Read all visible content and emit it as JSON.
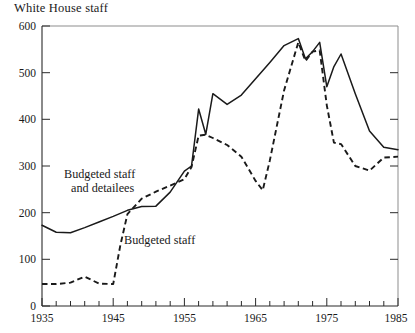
{
  "chart_data": {
    "type": "line",
    "title": "White House staff",
    "xlabel": "",
    "ylabel": "",
    "xlim": [
      1935,
      1985
    ],
    "ylim": [
      0,
      600
    ],
    "yticks": [
      0,
      100,
      200,
      300,
      400,
      500,
      600
    ],
    "ytick_labels": [
      "0",
      "100",
      "200",
      "300",
      "400",
      "500",
      "600"
    ],
    "xticks": [
      1935,
      1937,
      1939,
      1941,
      1943,
      1945,
      1947,
      1949,
      1951,
      1953,
      1955,
      1957,
      1959,
      1961,
      1963,
      1965,
      1967,
      1969,
      1971,
      1973,
      1975,
      1977,
      1979,
      1981,
      1983,
      1985
    ],
    "xtick_labels_shown": [
      "1935",
      "1945",
      "1955",
      "1965",
      "1975",
      "1985"
    ],
    "xtick_label_years": [
      1935,
      1945,
      1955,
      1965,
      1975,
      1985
    ],
    "grid": false,
    "legend_position": "inline-annotation",
    "series": [
      {
        "name": "Budgeted staff and detailees",
        "style": "solid",
        "label_text_line1": "Budgeted staff",
        "label_text_line2": "and detailees",
        "x": [
          1935,
          1937,
          1939,
          1941,
          1943,
          1945,
          1947,
          1949,
          1951,
          1953,
          1955,
          1956,
          1957,
          1958,
          1959,
          1961,
          1963,
          1965,
          1967,
          1969,
          1971,
          1972,
          1973,
          1974,
          1975,
          1976,
          1977,
          1979,
          1981,
          1983,
          1985
        ],
        "values": [
          173,
          158,
          157,
          168,
          180,
          192,
          205,
          213,
          214,
          244,
          289,
          300,
          422,
          368,
          455,
          432,
          452,
          487,
          522,
          558,
          573,
          530,
          545,
          565,
          470,
          513,
          540,
          455,
          375,
          340,
          335
        ]
      },
      {
        "name": "Budgeted staff",
        "style": "dashed",
        "label_text_line1": "Budgeted staff",
        "x": [
          1935,
          1937,
          1939,
          1941,
          1943,
          1945,
          1946,
          1947,
          1949,
          1951,
          1953,
          1955,
          1956,
          1957,
          1958,
          1959,
          1961,
          1963,
          1965,
          1966,
          1967,
          1969,
          1971,
          1972,
          1973,
          1974,
          1975,
          1976,
          1977,
          1979,
          1981,
          1983,
          1985
        ],
        "values": [
          47,
          47,
          50,
          63,
          48,
          47,
          130,
          197,
          230,
          245,
          258,
          272,
          298,
          365,
          367,
          360,
          345,
          320,
          268,
          248,
          312,
          462,
          565,
          525,
          545,
          548,
          430,
          350,
          347,
          300,
          290,
          318,
          320
        ]
      }
    ]
  }
}
